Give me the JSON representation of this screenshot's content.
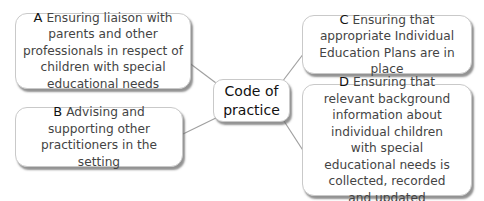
{
  "diagram": {
    "type": "mind-map",
    "center": {
      "label": "Code of practice",
      "line1": "Code of",
      "line2": "practice"
    },
    "nodes": [
      {
        "id": "A",
        "letter": "A",
        "text": "Ensuring liaison with parents and other professionals in respect of children with special educational needs"
      },
      {
        "id": "B",
        "letter": "B",
        "text": "Advising and supporting other practitioners in the setting"
      },
      {
        "id": "C",
        "letter": "C",
        "text": "Ensuring that appropriate Individual Education Plans are in place"
      },
      {
        "id": "D",
        "letter": "D",
        "text": "Ensuring that relevant background information about individual children with special educational needs is collected, recorded and updated"
      }
    ],
    "colors": {
      "box_border": "#c9c9c9",
      "shadow": "#6e6e6e",
      "text": "#444444",
      "letter": "#111111",
      "connector": "#a0a0a0"
    }
  }
}
